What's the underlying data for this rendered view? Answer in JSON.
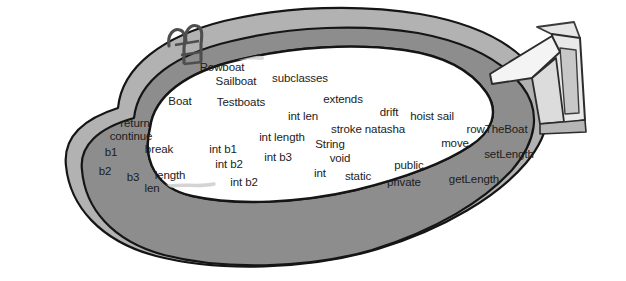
{
  "scene": {
    "title": "Swimming pool diagram with floating code words",
    "canvas_width": 626,
    "canvas_height": 281,
    "background_color": "#ffffff"
  },
  "colors": {
    "water": "#ffffff",
    "deck_outer": "#b0b0b0",
    "deck_inner": "#8f8f8f",
    "outline": "#161616",
    "ladder": "#5a5a5a",
    "diving_board_light": "#f2f2f2",
    "diving_board_mid": "#cdcdcd",
    "diving_board_dark": "#9a9a9a",
    "water_stroke": "#c9c9c9",
    "text": "#1c1c1c"
  },
  "objects": [
    {
      "name": "pool-deck-outer",
      "label": "outer pool deck band"
    },
    {
      "name": "pool-deck-inner",
      "label": "inner pool deck band"
    },
    {
      "name": "pool-water",
      "label": "pool water surface"
    },
    {
      "name": "pool-ladder",
      "label": "pool ladder"
    },
    {
      "name": "diving-board",
      "label": "diving board"
    },
    {
      "name": "water-brush-stroke",
      "label": "faint water brush stroke"
    }
  ],
  "words": [
    {
      "text": "Rowboat",
      "x": 222,
      "y": 68,
      "size": 11.5
    },
    {
      "text": "Sailboat",
      "x": 236,
      "y": 82,
      "size": 11.5
    },
    {
      "text": "subclasses",
      "x": 300,
      "y": 79,
      "size": 11.5
    },
    {
      "text": "Boat",
      "x": 180,
      "y": 102,
      "size": 11.5
    },
    {
      "text": "Testboats",
      "x": 241,
      "y": 103,
      "size": 11.5
    },
    {
      "text": "extends",
      "x": 343,
      "y": 100,
      "size": 11.5
    },
    {
      "text": "int len",
      "x": 303,
      "y": 117,
      "size": 11.5
    },
    {
      "text": "drift",
      "x": 389,
      "y": 113,
      "size": 11.5
    },
    {
      "text": "hoist sail",
      "x": 432,
      "y": 117,
      "size": 11.5
    },
    {
      "text": "return",
      "x": 135,
      "y": 124,
      "size": 11.5
    },
    {
      "text": "stroke natasha",
      "x": 368,
      "y": 130,
      "size": 11.5
    },
    {
      "text": "rowTheBoat",
      "x": 497,
      "y": 130,
      "size": 11.5
    },
    {
      "text": "continue",
      "x": 131,
      "y": 137,
      "size": 11.5
    },
    {
      "text": "int length",
      "x": 282,
      "y": 138,
      "size": 11.5
    },
    {
      "text": "String",
      "x": 330,
      "y": 145,
      "size": 11.5
    },
    {
      "text": "move",
      "x": 455,
      "y": 144,
      "size": 11.5
    },
    {
      "text": "b1",
      "x": 111,
      "y": 153,
      "size": 11.5
    },
    {
      "text": "break",
      "x": 159,
      "y": 150,
      "size": 11.5
    },
    {
      "text": "int b1",
      "x": 223,
      "y": 150,
      "size": 11.5
    },
    {
      "text": "int b3",
      "x": 278,
      "y": 158,
      "size": 11.5
    },
    {
      "text": "void",
      "x": 340,
      "y": 159,
      "size": 11.5
    },
    {
      "text": "setLength",
      "x": 509,
      "y": 155,
      "size": 11.5
    },
    {
      "text": "public",
      "x": 409,
      "y": 166,
      "size": 11.5
    },
    {
      "text": "b2",
      "x": 105,
      "y": 172,
      "size": 11.5
    },
    {
      "text": "b3",
      "x": 133,
      "y": 178,
      "size": 11.5
    },
    {
      "text": "length",
      "x": 170,
      "y": 176,
      "size": 11.5
    },
    {
      "text": "int b2",
      "x": 229,
      "y": 165,
      "size": 11.5
    },
    {
      "text": "int",
      "x": 320,
      "y": 174,
      "size": 11.5
    },
    {
      "text": "static",
      "x": 358,
      "y": 177,
      "size": 11.5
    },
    {
      "text": "getLength",
      "x": 474,
      "y": 180,
      "size": 11.5
    },
    {
      "text": "len",
      "x": 152,
      "y": 189,
      "size": 11.5
    },
    {
      "text": "int b2",
      "x": 244,
      "y": 183,
      "size": 11.5
    },
    {
      "text": "private",
      "x": 404,
      "y": 183,
      "size": 11.5
    }
  ]
}
